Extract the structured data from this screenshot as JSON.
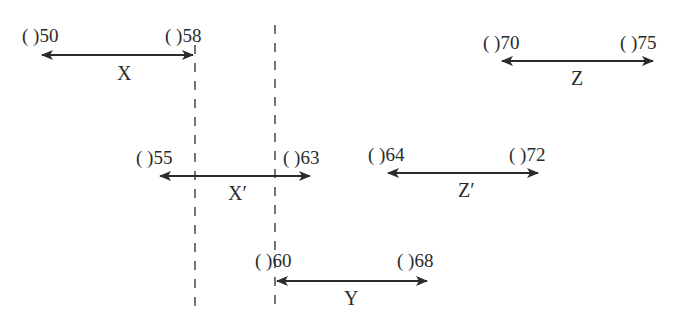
{
  "diagram": {
    "type": "interval-timeline",
    "colors": {
      "ink": "#2b2b2b",
      "background": "#ffffff"
    },
    "intervals": [
      {
        "id": "X",
        "name": "X",
        "start_label": "( )50",
        "end_label": "( )58",
        "start": 50,
        "end": 58
      },
      {
        "id": "Z",
        "name": "Z",
        "start_label": "( )70",
        "end_label": "( )75",
        "start": 70,
        "end": 75
      },
      {
        "id": "Xp",
        "name": "X′",
        "start_label": "( )55",
        "end_label": "( )63",
        "start": 55,
        "end": 63
      },
      {
        "id": "Zp",
        "name": "Z′",
        "start_label": "( )64",
        "end_label": "( )72",
        "start": 64,
        "end": 72
      },
      {
        "id": "Y",
        "name": "Y",
        "start_label": "( )60",
        "end_label": "( )68",
        "start": 60,
        "end": 68
      }
    ],
    "dashed_guides": [
      {
        "id": "guide-58",
        "at_value": 58
      },
      {
        "id": "guide-60",
        "at_value": 60
      }
    ]
  }
}
